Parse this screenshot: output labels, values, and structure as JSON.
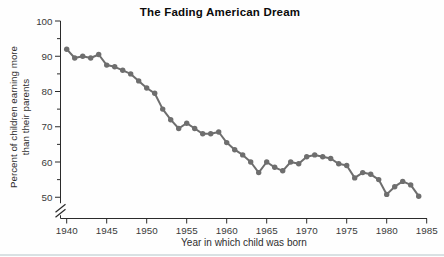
{
  "title": "The Fading American Dream",
  "chart_data": {
    "type": "line",
    "title": "The Fading American Dream",
    "xlabel": "Year in which child was born",
    "ylabel": "Percent of children earning more than their parents",
    "ylabel_lines": [
      "Percent of children earning more",
      "than their parents"
    ],
    "x": [
      1940,
      1941,
      1942,
      1943,
      1944,
      1945,
      1946,
      1947,
      1948,
      1949,
      1950,
      1951,
      1952,
      1953,
      1954,
      1955,
      1956,
      1957,
      1958,
      1959,
      1960,
      1961,
      1962,
      1963,
      1964,
      1965,
      1966,
      1967,
      1968,
      1969,
      1970,
      1971,
      1972,
      1973,
      1974,
      1975,
      1976,
      1977,
      1978,
      1979,
      1980,
      1981,
      1982,
      1983,
      1984
    ],
    "values": [
      92,
      89.5,
      90,
      89.5,
      90.5,
      87.5,
      87,
      86,
      85,
      83,
      81,
      79.5,
      75,
      72,
      69.5,
      71,
      69.5,
      68,
      68,
      68.5,
      65.5,
      63.5,
      62,
      60,
      57,
      60,
      58.5,
      57.5,
      60,
      59.5,
      61.5,
      62,
      61.5,
      61,
      59.5,
      59,
      55.5,
      57,
      56.5,
      55,
      50.8,
      53,
      54.5,
      53.5,
      50.3
    ],
    "x_ticks": [
      1940,
      1945,
      1950,
      1955,
      1960,
      1965,
      1970,
      1975,
      1980,
      1985
    ],
    "y_ticks": [
      100,
      90,
      80,
      70,
      60,
      50
    ],
    "y_minor_ticks": [
      95,
      85,
      75,
      65,
      55
    ],
    "ylim": [
      50,
      100
    ],
    "axis_break_below_y": 50,
    "grid": false,
    "legend": "none",
    "marker": "circle",
    "colors": {
      "series": "#6e6e6e",
      "axis": "#2b2b2b",
      "tick_text": "#3a3a3a",
      "title_text": "#0b0b0b"
    }
  },
  "footer": {
    "bottom_rule_color": "#cfd9dc"
  }
}
